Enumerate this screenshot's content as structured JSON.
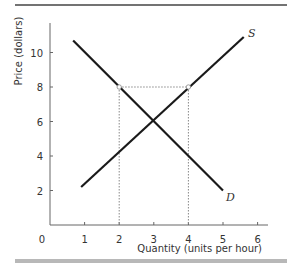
{
  "chart_data": {
    "type": "line",
    "title": "",
    "xlabel": "Quantity (units per hour)",
    "ylabel": "Price (dollars)",
    "xlim": [
      0,
      6.3
    ],
    "ylim": [
      0,
      11.5
    ],
    "x_ticks": [
      0,
      1,
      2,
      3,
      4,
      5,
      6
    ],
    "y_ticks": [
      2,
      4,
      6,
      8,
      10
    ],
    "x_tick_labels": [
      "0",
      "1",
      "2",
      "3",
      "4",
      "5",
      "6"
    ],
    "y_tick_labels": [
      "2",
      "4",
      "6",
      "8",
      "10"
    ],
    "grid": false,
    "legend": "none",
    "series": [
      {
        "name": "D",
        "label": "D",
        "points": [
          [
            0.67,
            10.7
          ],
          [
            5,
            2
          ]
        ],
        "color": "#1a1a1a"
      },
      {
        "name": "S",
        "label": "S",
        "points": [
          [
            0.9,
            2.2
          ],
          [
            5.6,
            10.9
          ]
        ],
        "color": "#1a1a1a"
      }
    ],
    "equilibrium": {
      "quantity": 3,
      "price": 6
    },
    "annotations": {
      "price_line": {
        "price": 8,
        "from_quantity": 2,
        "to_quantity": 4,
        "style": "dotted"
      },
      "markers": [
        [
          2,
          8
        ],
        [
          4,
          8
        ]
      ],
      "vertical_guides": [
        [
          2,
          8
        ],
        [
          4,
          8
        ]
      ]
    }
  },
  "labels": {
    "origin": "0",
    "demand": "D",
    "supply": "S",
    "x_axis": "Quantity (units per hour)",
    "y_axis": "Price (dollars)"
  }
}
